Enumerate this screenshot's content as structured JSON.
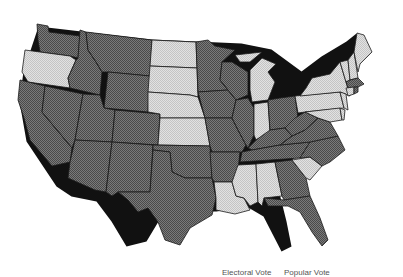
{
  "map": {
    "title": "United States election results map",
    "colors": {
      "dark": "#707070",
      "light": "#d8d8d8",
      "border": "#1a1a1a",
      "background": "#ffffff"
    },
    "states_light": [
      "OR",
      "ND",
      "SD",
      "NE",
      "KS",
      "MI",
      "IN",
      "NY",
      "PA",
      "NJ",
      "CT",
      "VT",
      "NH",
      "ME",
      "MD",
      "DE",
      "LA",
      "MS",
      "AL",
      "SC"
    ],
    "states_dark": [
      "WA",
      "ID",
      "MT",
      "WY",
      "CA",
      "NV",
      "UT",
      "CO",
      "AZ",
      "NM",
      "TX",
      "OK",
      "MN",
      "IA",
      "MO",
      "AR",
      "WI",
      "IL",
      "OH",
      "KY",
      "TN",
      "WV",
      "VA",
      "NC",
      "GA",
      "FL",
      "MA",
      "RI"
    ]
  },
  "legend": {
    "items": [
      {
        "label": "Electoral Vote"
      },
      {
        "label": "Popular Vote"
      }
    ]
  }
}
